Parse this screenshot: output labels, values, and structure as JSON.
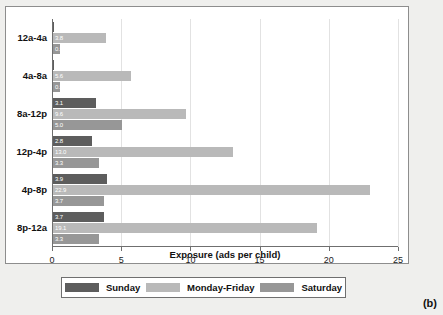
{
  "chart_data": {
    "type": "bar",
    "orientation": "horizontal",
    "title": "",
    "xlabel": "Exposure (ads per child)",
    "ylabel": "",
    "xlim": [
      0,
      25
    ],
    "xticks": [
      0,
      5,
      10,
      15,
      20,
      25
    ],
    "grid": true,
    "legend_position": "bottom",
    "categories": [
      "12a-4a",
      "4a-8a",
      "8a-12p",
      "12p-4p",
      "4p-8p",
      "8p-12a"
    ],
    "series": [
      {
        "name": "Sunday",
        "color": "#5d5d5d",
        "values": [
          0,
          0,
          3.1,
          2.8,
          3.9,
          3.7
        ],
        "labels": [
          "0",
          "0",
          "3.1",
          "2.8",
          "3.9",
          "3.7"
        ]
      },
      {
        "name": "Monday-Friday",
        "color": "#b9b9b9",
        "values": [
          3.8,
          5.6,
          9.6,
          13.0,
          22.9,
          19.1
        ],
        "labels": [
          "3.8",
          "5.6",
          "9.6",
          "13.0",
          "22.9",
          "19.1"
        ]
      },
      {
        "name": "Saturday",
        "color": "#979797",
        "values": [
          0.5,
          0.5,
          5.0,
          3.3,
          3.7,
          3.3
        ],
        "labels": [
          "0.5",
          "0.5",
          "5.0",
          "3.3",
          "3.7",
          "3.3"
        ]
      }
    ]
  },
  "panel": {
    "label": "(b)"
  }
}
